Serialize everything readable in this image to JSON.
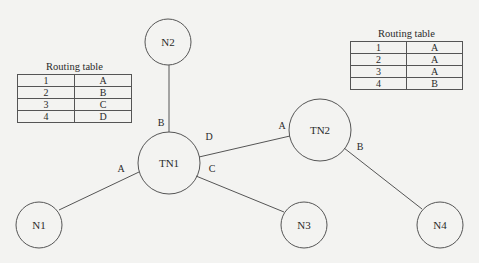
{
  "diagram": {
    "nodes": [
      {
        "id": "N2",
        "label": "N2"
      },
      {
        "id": "TN1",
        "label": "TN1"
      },
      {
        "id": "TN2",
        "label": "TN2"
      },
      {
        "id": "N1",
        "label": "N1"
      },
      {
        "id": "N3",
        "label": "N3"
      },
      {
        "id": "N4",
        "label": "N4"
      }
    ],
    "links": [
      {
        "from": "TN1",
        "to": "N2",
        "port": "B"
      },
      {
        "from": "TN1",
        "to": "N1",
        "port": "A"
      },
      {
        "from": "TN1",
        "to": "N3",
        "port": "C"
      },
      {
        "from": "TN1",
        "to": "TN2",
        "port": "D"
      },
      {
        "from": "TN2",
        "to": "TN1",
        "port": "A"
      },
      {
        "from": "TN2",
        "to": "N4",
        "port": "B"
      }
    ],
    "port_labels": {
      "tn1_b": "B",
      "tn1_a": "A",
      "tn1_c": "C",
      "tn1_d": "D",
      "tn2_a": "A",
      "tn2_b": "B"
    }
  },
  "routing_tables": {
    "tn1": {
      "title": "Routing table",
      "rows": [
        {
          "dest": "1",
          "port": "A"
        },
        {
          "dest": "2",
          "port": "B"
        },
        {
          "dest": "3",
          "port": "C"
        },
        {
          "dest": "4",
          "port": "D"
        }
      ]
    },
    "tn2": {
      "title": "Routing table",
      "rows": [
        {
          "dest": "1",
          "port": "A"
        },
        {
          "dest": "2",
          "port": "A"
        },
        {
          "dest": "3",
          "port": "A"
        },
        {
          "dest": "4",
          "port": "B"
        }
      ]
    }
  }
}
